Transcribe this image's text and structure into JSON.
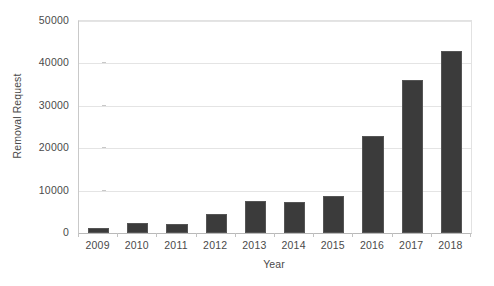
{
  "chart_data": {
    "type": "bar",
    "title": "",
    "xlabel": "Year",
    "ylabel": "Removal Request",
    "categories": [
      "2009",
      "2010",
      "2011",
      "2012",
      "2013",
      "2014",
      "2015",
      "2016",
      "2017",
      "2018"
    ],
    "values": [
      1200,
      2300,
      2200,
      4500,
      7500,
      7200,
      8800,
      22800,
      36000,
      43000
    ],
    "ylim": [
      0,
      50000
    ],
    "yticks": [
      0,
      10000,
      20000,
      30000,
      40000,
      50000
    ],
    "ytick_labels": [
      "0",
      "10000",
      "20000",
      "30000",
      "40000",
      "50000"
    ],
    "grid": true,
    "legend": false,
    "bar_color": "#3b3b3b",
    "bar_edge_color": "#555555",
    "grid_color": "#e4e4e4",
    "axis_color": "#b9b9b9",
    "text_color": "#4a4a4a"
  }
}
